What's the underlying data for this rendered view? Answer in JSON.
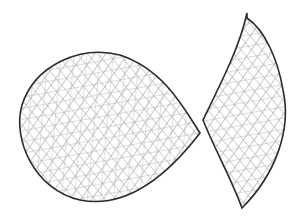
{
  "drawing": {
    "style": "pencil-sketch-crosshatch",
    "background": "#ffffff",
    "outline_color": "#2a2a2a",
    "hatch_color": "#9a9a9a",
    "shapes": [
      {
        "name": "round-blob",
        "path": "M 200 133 C 185 110, 165 70, 120 55 C 80 45, 35 65, 22 105 C 12 140, 35 190, 80 200 C 120 208, 160 185, 200 133 Z",
        "bbox": [
          20,
          50,
          200,
          205
        ]
      },
      {
        "name": "leaf-crescent",
        "path": "M 247 13 C 240 45, 225 75, 203 120 C 215 150, 232 180, 242 208 C 275 175, 292 130, 283 90 C 278 60, 265 30, 247 18 Z",
        "bbox": [
          200,
          13,
          287,
          208
        ]
      }
    ]
  }
}
